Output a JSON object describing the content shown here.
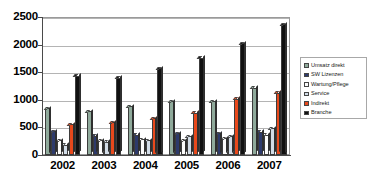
{
  "chart_data": {
    "type": "bar",
    "title": "",
    "subtitle": "",
    "xlabel": "",
    "ylabel": "",
    "categories": [
      "2002",
      "2003",
      "2004",
      "2005",
      "2006",
      "2007"
    ],
    "ylim": [
      0,
      2500
    ],
    "ytick_labels": [
      "0",
      "500",
      "1000",
      "1500",
      "2000",
      "2500"
    ],
    "ytick_values": [
      0,
      500,
      1000,
      1500,
      2000,
      2500
    ],
    "ytick_step": 500,
    "grid": "horizontal",
    "legend_position": "right",
    "series": [
      {
        "name": "Umsatz direkt",
        "color": "#8faa9b",
        "values": [
          850,
          790,
          880,
          980,
          980,
          1220
        ]
      },
      {
        "name": "SW Lizenzen",
        "color": "#2d3a6b",
        "values": [
          430,
          350,
          370,
          400,
          390,
          420
        ]
      },
      {
        "name": "Wartung/Pflege",
        "color": "#fbfbfb",
        "values": [
          270,
          270,
          290,
          270,
          300,
          370
        ]
      },
      {
        "name": "Service",
        "color": "#d3dde8",
        "values": [
          190,
          240,
          270,
          340,
          340,
          490
        ]
      },
      {
        "name": "Indirekt",
        "color": "#e8491c",
        "values": [
          560,
          600,
          670,
          770,
          1020,
          1130
        ]
      },
      {
        "name": "Branche",
        "color": "#111111",
        "values": [
          1440,
          1400,
          1570,
          1760,
          2030,
          2370
        ]
      }
    ]
  },
  "legend": {
    "items": [
      {
        "label": "Umsatz direkt",
        "color": "#8faa9b"
      },
      {
        "label": "SW Lizenzen",
        "color": "#2d3a6b"
      },
      {
        "label": "Wartung/Pflege",
        "color": "#fbfbfb"
      },
      {
        "label": "Service",
        "color": "#d3dde8"
      },
      {
        "label": "Indirekt",
        "color": "#e8491c"
      },
      {
        "label": "Branche",
        "color": "#111111"
      }
    ]
  }
}
